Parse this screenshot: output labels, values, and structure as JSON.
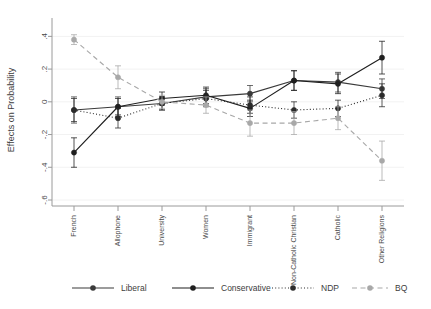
{
  "chart_data": {
    "type": "line",
    "title": "",
    "subtitle": "",
    "xlabel": "",
    "ylabel": "Effects on Probability",
    "ylim": [
      -0.6,
      0.5
    ],
    "yticks": [
      0.4,
      0.2,
      0,
      -0.2,
      -0.4,
      -0.6
    ],
    "ytick_labels": [
      ".4",
      ".2",
      "0",
      "-.2",
      "-.4",
      "-.6"
    ],
    "grid": "horizontal-faint",
    "legend_position": "bottom",
    "categories": [
      "French",
      "Allophone",
      "University",
      "Women",
      "Immigrant",
      "Non-Catholic Christian",
      "Catholic",
      "Other Religions"
    ],
    "series": [
      {
        "name": "Liberal",
        "color": "#3a3a3a",
        "dash": "solid",
        "marker": "circle",
        "values": [
          -0.05,
          -0.03,
          -0.01,
          0.03,
          0.05,
          0.13,
          0.12,
          0.08
        ],
        "ci_low": [
          -0.13,
          -0.09,
          -0.05,
          -0.02,
          0.0,
          0.07,
          0.06,
          0.02
        ],
        "ci_high": [
          0.03,
          0.03,
          0.03,
          0.08,
          0.1,
          0.19,
          0.18,
          0.14
        ]
      },
      {
        "name": "Conservative",
        "color": "#1f1f1f",
        "dash": "solid",
        "marker": "circle",
        "values": [
          -0.31,
          -0.03,
          0.02,
          0.04,
          -0.04,
          0.13,
          0.11,
          0.27
        ],
        "ci_low": [
          -0.4,
          -0.08,
          -0.02,
          -0.01,
          -0.09,
          0.07,
          0.05,
          0.17
        ],
        "ci_high": [
          -0.22,
          0.02,
          0.06,
          0.09,
          0.01,
          0.19,
          0.17,
          0.37
        ]
      },
      {
        "name": "NDP",
        "color": "#2b2b2b",
        "dash": "dotted",
        "marker": "circle",
        "values": [
          -0.05,
          -0.1,
          -0.01,
          0.02,
          -0.02,
          -0.05,
          -0.04,
          0.04
        ],
        "ci_low": [
          -0.12,
          -0.16,
          -0.05,
          -0.03,
          -0.07,
          -0.1,
          -0.09,
          -0.03
        ],
        "ci_high": [
          0.02,
          -0.04,
          0.03,
          0.07,
          0.03,
          0.0,
          0.01,
          0.11
        ]
      },
      {
        "name": "BQ",
        "color": "#a8a8a8",
        "dash": "dashed",
        "marker": "circle",
        "values": [
          0.38,
          0.15,
          0.0,
          -0.02,
          -0.13,
          -0.13,
          -0.1,
          -0.36
        ],
        "ci_low": [
          0.35,
          0.08,
          -0.04,
          -0.07,
          -0.21,
          -0.2,
          -0.17,
          -0.48
        ],
        "ci_high": [
          0.41,
          0.22,
          0.04,
          0.03,
          -0.05,
          -0.06,
          -0.03,
          -0.24
        ]
      }
    ]
  },
  "legend": {
    "items": [
      {
        "label": "Liberal"
      },
      {
        "label": "Conservative"
      },
      {
        "label": "NDP"
      },
      {
        "label": "BQ"
      }
    ]
  }
}
